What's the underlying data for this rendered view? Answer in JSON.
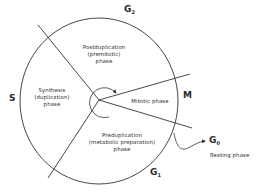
{
  "diagram": {
    "colors": {
      "stroke": "#333333",
      "text": "#2a2a2a",
      "background": "#ffffff"
    },
    "phases": {
      "g2": {
        "letter": "G",
        "sub": "2",
        "name_line1": "Postduplication",
        "name_line2": "(premitotic)",
        "name_line3": "phase"
      },
      "s": {
        "letter": "S",
        "name_line1": "Synthesis",
        "name_line2": "(duplication)",
        "name_line3": "phase"
      },
      "m": {
        "letter": "M",
        "name": "Mitotic phase"
      },
      "g1": {
        "letter": "G",
        "sub": "1",
        "name_line1": "Preduplication",
        "name_line2": "(metabolic preparation)",
        "name_line3": "phase"
      },
      "g0": {
        "letter": "G",
        "sub": "0",
        "name": "Resting phase"
      }
    }
  }
}
